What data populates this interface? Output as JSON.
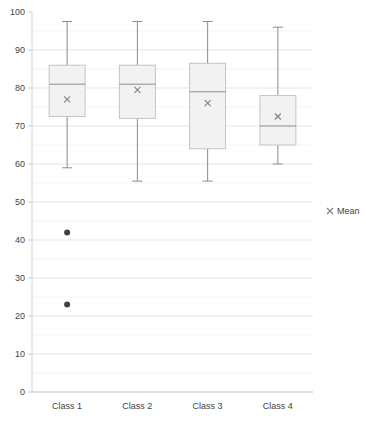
{
  "chart_data": {
    "type": "box",
    "title": "",
    "xlabel": "",
    "ylabel": "",
    "ylim": [
      0,
      100
    ],
    "ytick_step": 10,
    "minor_gridline_step": 5,
    "grid": true,
    "categories": [
      "Class 1",
      "Class 2",
      "Class 3",
      "Class 4"
    ],
    "ytick_labels": [
      "0",
      "10",
      "20",
      "30",
      "40",
      "50",
      "60",
      "70",
      "80",
      "90",
      "100"
    ],
    "legend": {
      "position": "right",
      "entries": [
        {
          "label": "Mean",
          "marker": "x",
          "color": "#808080"
        }
      ]
    },
    "boxes": [
      {
        "category": "Class 1",
        "whisker_low": 59,
        "q1": 72.5,
        "median": 81,
        "mean": 77,
        "q3": 86,
        "whisker_high": 97.5,
        "outliers": [
          42,
          23
        ]
      },
      {
        "category": "Class 2",
        "whisker_low": 55.5,
        "q1": 72,
        "median": 81,
        "mean": 79.5,
        "q3": 86,
        "whisker_high": 97.5,
        "outliers": []
      },
      {
        "category": "Class 3",
        "whisker_low": 55.5,
        "q1": 64,
        "median": 79,
        "mean": 76,
        "q3": 86.5,
        "whisker_high": 97.5,
        "outliers": []
      },
      {
        "category": "Class 4",
        "whisker_low": 60,
        "q1": 65,
        "median": 70,
        "mean": 72.5,
        "q3": 78,
        "whisker_high": 96,
        "outliers": []
      }
    ]
  },
  "axis": {
    "y_max_label": "100",
    "y_min_label": "0"
  }
}
